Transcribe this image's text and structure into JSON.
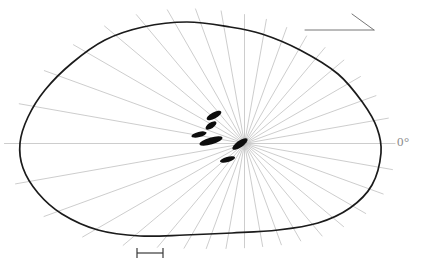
{
  "figure": {
    "background_color": "#ffffff",
    "zero_degree_label": "0°",
    "outline": {
      "color": "#1b1b1b",
      "stroke_width": 1.7,
      "points": [
        [
          187,
          22
        ],
        [
          230,
          27
        ],
        [
          262,
          34
        ],
        [
          300,
          50
        ],
        [
          338,
          74
        ],
        [
          363,
          103
        ],
        [
          377,
          128
        ],
        [
          381,
          153
        ],
        [
          372,
          185
        ],
        [
          350,
          208
        ],
        [
          318,
          223
        ],
        [
          278,
          230
        ],
        [
          232,
          233
        ],
        [
          185,
          235
        ],
        [
          140,
          236
        ],
        [
          98,
          230
        ],
        [
          62,
          214
        ],
        [
          38,
          193
        ],
        [
          23,
          168
        ],
        [
          20,
          143
        ],
        [
          28,
          117
        ],
        [
          45,
          90
        ],
        [
          72,
          63
        ],
        [
          105,
          40
        ],
        [
          143,
          27
        ]
      ]
    },
    "radial_fan": {
      "center_x": 244.5,
      "center_y": 143.5,
      "line_count": 36,
      "interval_deg": 10,
      "overshoot_px": 16,
      "color": "#bcbcbc",
      "stroke_width": 0.75
    },
    "organelles": {
      "color": "#0d0d0d",
      "items": [
        {
          "cx": 214,
          "cy": 115.5,
          "rx": 8.2,
          "ry": 3.1,
          "rot": -28
        },
        {
          "cx": 211,
          "cy": 125.5,
          "rx": 6.2,
          "ry": 2.9,
          "rot": -33
        },
        {
          "cx": 199,
          "cy": 134.5,
          "rx": 7.8,
          "ry": 2.6,
          "rot": -14
        },
        {
          "cx": 211,
          "cy": 141,
          "rx": 12,
          "ry": 3.5,
          "rot": -17
        },
        {
          "cx": 240,
          "cy": 144,
          "rx": 9,
          "ry": 3.3,
          "rot": -35
        },
        {
          "cx": 227.5,
          "cy": 159.5,
          "rx": 7.8,
          "ry": 2.6,
          "rot": -15
        }
      ]
    },
    "arrow": {
      "color": "#777777",
      "stroke_width": 1,
      "x1": 305,
      "y1": 30,
      "x2": 374,
      "y2": 30,
      "barb_x": 352,
      "barb_y": 14
    },
    "scale_bar": {
      "color": "#3a3a3a",
      "stroke_width": 1.2,
      "x1": 137,
      "x2": 163,
      "y": 253,
      "cap_half_height": 5
    }
  }
}
